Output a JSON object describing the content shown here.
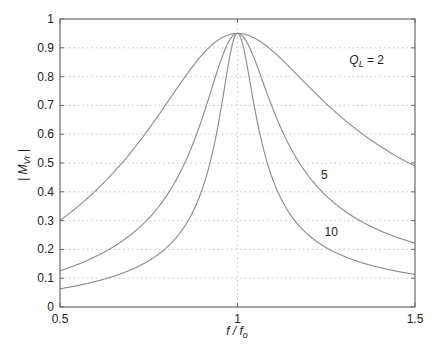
{
  "chart_data": {
    "type": "line",
    "title": "",
    "xlabel": "f / f_o",
    "ylabel": "| M_Vr |",
    "xlim": [
      0.5,
      1.5
    ],
    "ylim": [
      0,
      1
    ],
    "x_ticks": [
      0.5,
      1,
      1.5
    ],
    "x_tick_labels": [
      "0.5",
      "1",
      "1.5"
    ],
    "y_ticks": [
      0,
      0.1,
      0.2,
      0.3,
      0.4,
      0.5,
      0.6,
      0.7,
      0.8,
      0.9,
      1
    ],
    "y_tick_labels": [
      "0",
      "0.1",
      "0.2",
      "0.3",
      "0.4",
      "0.5",
      "0.6",
      "0.7",
      "0.8",
      "0.9",
      "1"
    ],
    "grid": {
      "horizontal": true,
      "vertical_at": [
        1
      ],
      "style": "dotted"
    },
    "legend": null,
    "model": {
      "formula": "M = peak / sqrt(1 + Q^2 (f - 1/f)^2)",
      "peak": 0.95
    },
    "x": [
      0.5,
      0.55,
      0.6,
      0.65,
      0.7,
      0.75,
      0.8,
      0.85,
      0.9,
      0.95,
      1.0,
      1.05,
      1.1,
      1.15,
      1.2,
      1.25,
      1.3,
      1.35,
      1.4,
      1.45,
      1.5
    ],
    "series": [
      {
        "name": "Q_L = 2",
        "Q": 2,
        "values": [
          0.3,
          0.349,
          0.403,
          0.466,
          0.537,
          0.618,
          0.706,
          0.796,
          0.875,
          0.931,
          0.95,
          0.932,
          0.887,
          0.829,
          0.766,
          0.706,
          0.651,
          0.603,
          0.56,
          0.522,
          0.489
        ]
      },
      {
        "name": "5",
        "Q": 5,
        "values": [
          0.126,
          0.148,
          0.175,
          0.209,
          0.251,
          0.308,
          0.386,
          0.498,
          0.654,
          0.845,
          0.95,
          0.853,
          0.687,
          0.552,
          0.454,
          0.386,
          0.335,
          0.296,
          0.266,
          0.242,
          0.222
        ]
      },
      {
        "name": "10",
        "Q": 10,
        "values": [
          0.063,
          0.075,
          0.089,
          0.106,
          0.129,
          0.16,
          0.206,
          0.279,
          0.408,
          0.662,
          0.95,
          0.679,
          0.441,
          0.32,
          0.25,
          0.206,
          0.176,
          0.154,
          0.137,
          0.124,
          0.113
        ]
      }
    ],
    "annotations": [
      {
        "text_main": "Q",
        "text_sub": "L",
        "text_rest": " = 2",
        "x": 1.315,
        "y": 0.845
      },
      {
        "text": "5",
        "x": 1.235,
        "y": 0.445
      },
      {
        "text": "10",
        "x": 1.245,
        "y": 0.245
      }
    ]
  },
  "axis_text": {
    "ylabel_left": "| M",
    "ylabel_sub": "Vr",
    "ylabel_right": " |",
    "xlabel_f": "f / f",
    "xlabel_sub": "o"
  }
}
